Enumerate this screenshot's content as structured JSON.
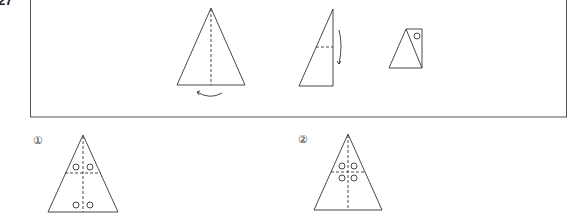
{
  "question": {
    "number": "27"
  },
  "folding_steps": [
    {
      "id": "step-1",
      "description": "isosceles triangle with vertical fold line, folded along center",
      "arrow": "curved arrow below base"
    },
    {
      "id": "step-2",
      "description": "right triangle (half), horizontal fold line, folded downward",
      "arrow": "curved arrow on right side pointing down"
    },
    {
      "id": "step-3",
      "description": "folded shape with one punched hole",
      "holes": 1
    }
  ],
  "options": [
    {
      "label": "①",
      "holes": 4,
      "hole_positions": "two above horizontal fold, two at base"
    },
    {
      "label": "②",
      "holes": 4,
      "hole_positions": "two above and two below horizontal fold"
    },
    {
      "label": "③",
      "holes": null
    },
    {
      "label": "④",
      "holes": null
    }
  ],
  "colors": {
    "line": "#333333",
    "background": "#ffffff"
  }
}
